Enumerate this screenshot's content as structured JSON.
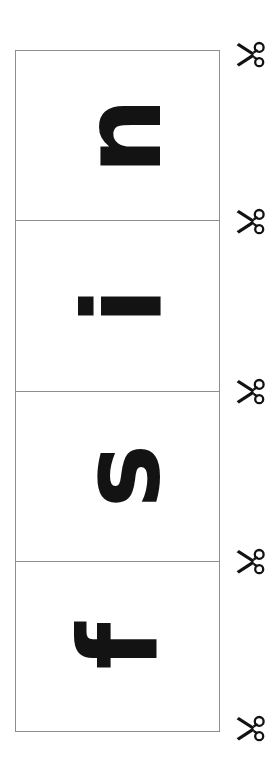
{
  "sheet": {
    "title": "Letter cut-out sheet",
    "background_color": "#ffffff",
    "border_color": "#8d8d8d",
    "ink_color": "#131313",
    "width": 279,
    "height": 777
  },
  "grid": {
    "name": "letter-card-column",
    "columns": 1,
    "rows": 4,
    "left": 15,
    "top": 50,
    "width": 205,
    "height": 682,
    "cell_height": 170,
    "cells": [
      {
        "index": 1,
        "letter": "n",
        "rotation_deg": -90,
        "case": "lowercase"
      },
      {
        "index": 2,
        "letter": "i",
        "rotation_deg": -90,
        "case": "lowercase"
      },
      {
        "index": 3,
        "letter": "s",
        "rotation_deg": -90,
        "case": "lowercase"
      },
      {
        "index": 4,
        "letter": "f",
        "rotation_deg": -90,
        "case": "lowercase"
      }
    ],
    "word_reading_order": "n i s f"
  },
  "cut_marks": {
    "icon": "scissors-icon",
    "count": 5,
    "left": 234,
    "positions_y": [
      38,
      205,
      375,
      545,
      712
    ],
    "orientation": "blades-left-handles-right"
  }
}
